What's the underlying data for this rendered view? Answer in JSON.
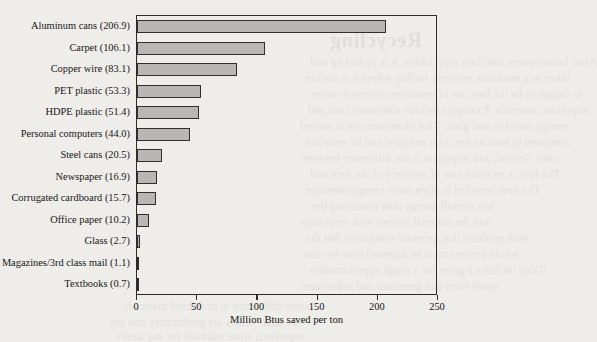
{
  "chart_data": {
    "type": "bar",
    "orientation": "horizontal",
    "title": "",
    "xlabel": "Million Btus saved per ton",
    "ylabel": "",
    "xlim": [
      0,
      250
    ],
    "xticks": [
      0,
      50,
      100,
      150,
      200,
      250
    ],
    "grid": false,
    "legend": null,
    "categories": [
      "Aluminum cans",
      "Carpet",
      "Copper wire",
      "PET plastic",
      "HDPE plastic",
      "Personal computers",
      "Steel cans",
      "Newspaper",
      "Corrugated cardboard",
      "Office paper",
      "Glass",
      "Magazines/3rd class mail",
      "Textbooks"
    ],
    "values": [
      206.9,
      106.1,
      83.1,
      53.3,
      51.4,
      44.0,
      20.5,
      16.9,
      15.7,
      10.2,
      2.7,
      1.1,
      0.7
    ],
    "tick_labels": [
      "0",
      "50",
      "100",
      "150",
      "200",
      "250"
    ],
    "category_labels": [
      "Aluminum cans (206.9)",
      "Carpet (106.1)",
      "Copper wire (83.1)",
      "PET plastic (53.3)",
      "HDPE plastic (51.4)",
      "Personal computers (44.0)",
      "Steel cans (20.5)",
      "Newspaper (16.9)",
      "Corrugated cardboard (15.7)",
      "Office paper (10.2)",
      "Glass (2.7)",
      "Magazines/3rd class mail (1.1)",
      "Textbooks (0.7)"
    ],
    "colors": {
      "bar_fill": "#b9b7b4",
      "bar_edge": "#2f2f2f",
      "axis": "#2b2b2b",
      "text": "#141414",
      "background": "#efedea"
    }
  },
  "page_bleed": {
    "title": "Recycling",
    "lines": [
      "After homeowners sort their recyclables, it is picked up and",
      "taken to a materials recovery facility where it is further",
      "ly though to be the best use of resources to recycle some",
      "important materials. Examples include aluminum cans and",
      "energy saved in and glass. That aluminum can is melted",
      "compared to bauxite ore. Iron and steel can be remelted",
      "cans. Second, and important is the difference between",
      "The first is recycled rate of recovery of the item and",
      "The item recycled is often more energy-intensive",
      "less overall energy than producing the",
      "into the material system with recyclable",
      "with products that generate conditions, but the",
      "whole process must be assessed case-by-case",
      "Table includes figures for a rough approximation",
      "waste form that generates and subsequent",
      "some difference in processed materials.",
      "the data. Values are preliminary and pre",
      "represents some estimate for any item's"
    ]
  }
}
